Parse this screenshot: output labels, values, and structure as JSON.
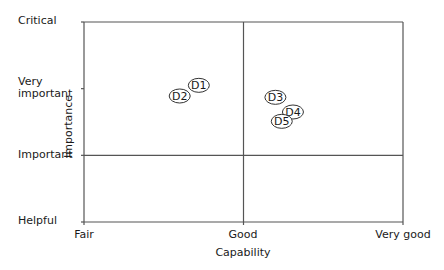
{
  "chart_data": {
    "type": "scatter",
    "title": "",
    "xlabel": "Capability",
    "ylabel": "Importance",
    "x_ticks": [
      {
        "value": 0,
        "label": "Fair"
      },
      {
        "value": 1,
        "label": "Good"
      },
      {
        "value": 2,
        "label": "Very good"
      }
    ],
    "y_ticks": [
      {
        "value": 0,
        "label": "Helpful"
      },
      {
        "value": 1,
        "label": "Important"
      },
      {
        "value": 2,
        "label": "Very important"
      },
      {
        "value": 3,
        "label": "Critical"
      }
    ],
    "xlim": [
      0,
      2
    ],
    "ylim": [
      0,
      3
    ],
    "quadrant_lines": {
      "x": 1,
      "y": 1
    },
    "grid": false,
    "legend": null,
    "points": [
      {
        "label": "D1",
        "x": 0.72,
        "y": 2.05
      },
      {
        "label": "D2",
        "x": 0.6,
        "y": 1.89
      },
      {
        "label": "D3",
        "x": 1.2,
        "y": 1.87
      },
      {
        "label": "D4",
        "x": 1.31,
        "y": 1.65
      },
      {
        "label": "D5",
        "x": 1.24,
        "y": 1.51
      }
    ]
  },
  "labels": {
    "x_axis_title": "Capability",
    "y_axis_title": "Importance",
    "x_tick_fair": "Fair",
    "x_tick_good": "Good",
    "x_tick_very_good": "Very good",
    "y_tick_critical": "Critical",
    "y_tick_very_important_1": "Very",
    "y_tick_very_important_2": "important",
    "y_tick_important": "Important",
    "y_tick_helpful": "Helpful"
  },
  "colors": {
    "line": "#555555",
    "text": "#1a1a1a",
    "background": "#ffffff"
  }
}
